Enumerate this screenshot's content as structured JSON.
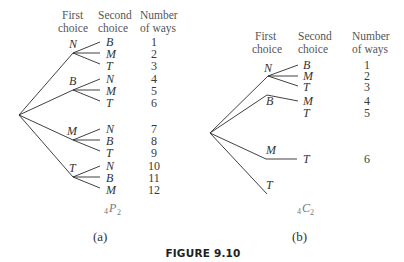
{
  "figure": {
    "caption": "FIGURE 9.10"
  },
  "panel_a": {
    "label": "(a)",
    "headers": {
      "first_line1": "First",
      "first_line2": "choice",
      "second_line1": "Second",
      "second_line2": "choice",
      "ways_line1": "Number",
      "ways_line2": "of ways"
    },
    "first_choices": [
      "N",
      "B",
      "M",
      "T"
    ],
    "second_choices": [
      "B",
      "M",
      "T",
      "N",
      "M",
      "T",
      "N",
      "B",
      "T",
      "N",
      "B",
      "M"
    ],
    "ways": [
      "1",
      "2",
      "3",
      "4",
      "5",
      "6",
      "7",
      "8",
      "9",
      "10",
      "11",
      "12"
    ],
    "notation_prefix": "4",
    "notation_letter": "P",
    "notation_suffix": "2"
  },
  "panel_b": {
    "label": "(b)",
    "headers": {
      "first_line1": "First",
      "first_line2": "choice",
      "second_line1": "Second",
      "second_line2": "choice",
      "ways_line1": "Number",
      "ways_line2": "of ways"
    },
    "first_choices": [
      "N",
      "B",
      "M",
      "T"
    ],
    "second_choices": [
      "B",
      "M",
      "T",
      "M",
      "T",
      "T"
    ],
    "ways": [
      "1",
      "2",
      "3",
      "4",
      "5",
      "6"
    ],
    "notation_prefix": "4",
    "notation_letter": "C",
    "notation_suffix": "2"
  }
}
